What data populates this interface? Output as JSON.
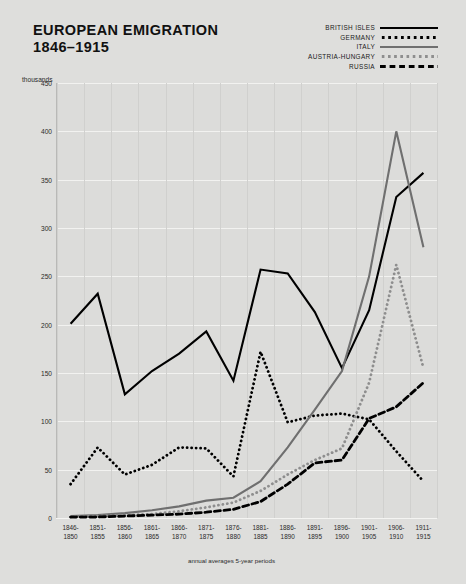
{
  "header": {
    "title": "EUROPEAN EMIGRATION",
    "subtitle": "1846–1915"
  },
  "units_label": "thousands",
  "x_caption": "annual averages 5-year periods",
  "legend": {
    "position": "top-right",
    "items": [
      {
        "label": "BRITISH ISLES",
        "style": "solid",
        "color": "#000000",
        "swatch_class": "sw-solid-black"
      },
      {
        "label": "GERMANY",
        "style": "dotted",
        "color": "#000000",
        "swatch_class": "sw-dot-black"
      },
      {
        "label": "ITALY",
        "style": "solid",
        "color": "#6f6f6f",
        "swatch_class": "sw-solid-gray"
      },
      {
        "label": "AUSTRIA-HUNGARY",
        "style": "dotted",
        "color": "#8e8e8e",
        "swatch_class": "sw-dot-gray"
      },
      {
        "label": "RUSSIA",
        "style": "dashed",
        "color": "#000000",
        "swatch_class": "sw-dash-black"
      }
    ]
  },
  "chart_data": {
    "type": "line",
    "title": "EUROPEAN EMIGRATION 1846–1915",
    "xlabel": "annual averages 5-year periods",
    "ylabel": "thousands",
    "ylim": [
      0,
      450
    ],
    "yticks": [
      0,
      50,
      100,
      150,
      200,
      250,
      300,
      350,
      400,
      450
    ],
    "grid": true,
    "categories": [
      "1846-\n1850",
      "1851-\n1855",
      "1856-\n1860",
      "1861-\n1865",
      "1866-\n1870",
      "1871-\n1875",
      "1876-\n1880",
      "1881-\n1885",
      "1886-\n1890",
      "1891-\n1895",
      "1896-\n1900",
      "1901-\n1905",
      "1906-\n1910",
      "1911-\n1915"
    ],
    "series": [
      {
        "name": "BRITISH ISLES",
        "color": "#000000",
        "style": "solid",
        "values": [
          201,
          232,
          128,
          152,
          170,
          193,
          142,
          257,
          253,
          213,
          155,
          215,
          332,
          357
        ]
      },
      {
        "name": "GERMANY",
        "color": "#000000",
        "style": "dotted",
        "values": [
          35,
          73,
          45,
          55,
          73,
          72,
          43,
          172,
          99,
          106,
          108,
          102,
          69,
          38
        ]
      },
      {
        "name": "ITALY",
        "color": "#6f6f6f",
        "style": "solid",
        "values": [
          2,
          3,
          5,
          8,
          12,
          18,
          21,
          38,
          73,
          112,
          152,
          250,
          400,
          280
        ]
      },
      {
        "name": "AUSTRIA-HUNGARY",
        "color": "#8e8e8e",
        "style": "dotted",
        "values": [
          1,
          2,
          3,
          4,
          7,
          11,
          16,
          28,
          45,
          60,
          72,
          140,
          262,
          155
        ]
      },
      {
        "name": "RUSSIA",
        "color": "#000000",
        "style": "dashed",
        "values": [
          1,
          1,
          2,
          3,
          4,
          6,
          9,
          17,
          35,
          57,
          60,
          103,
          115,
          140
        ]
      }
    ]
  }
}
